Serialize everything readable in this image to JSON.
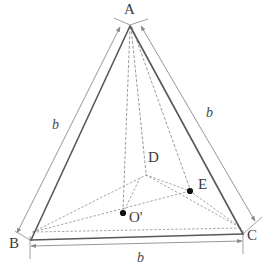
{
  "figure": {
    "kind": "geometry-diagram",
    "width": 274,
    "height": 277,
    "background_color": "#ffffff",
    "edge_color": "#555555",
    "dimension_color": "#8a8a8a",
    "construction_color": "#999999",
    "point_color": "#111111",
    "label_color": "#3b3b3b"
  },
  "vertices": [
    {
      "id": "A",
      "label": "A",
      "x": 130,
      "y": 25,
      "label_x": 124,
      "label_y": 2,
      "dot": false
    },
    {
      "id": "B",
      "label": "B",
      "x": 30,
      "y": 240,
      "label_x": 9,
      "label_y": 236,
      "dot": false
    },
    {
      "id": "C",
      "label": "C",
      "x": 243,
      "y": 234,
      "label_x": 247,
      "label_y": 228,
      "dot": false
    },
    {
      "id": "D",
      "label": "D",
      "x": 146,
      "y": 175,
      "label_x": 148,
      "label_y": 150,
      "dot": false
    },
    {
      "id": "E",
      "label": "E",
      "x": 190,
      "y": 191,
      "label_x": 198,
      "label_y": 177,
      "dot": true
    },
    {
      "id": "O'",
      "label": "O'",
      "x": 123,
      "y": 213,
      "label_x": 129,
      "label_y": 210,
      "dot": true
    }
  ],
  "edges": [
    {
      "from": "A",
      "to": "B",
      "style": "solid"
    },
    {
      "from": "A",
      "to": "C",
      "style": "solid"
    },
    {
      "from": "B",
      "to": "C",
      "style": "solid"
    }
  ],
  "construction_lines": [
    {
      "from": "A",
      "to": "O'",
      "style": "dashed"
    },
    {
      "from": "A",
      "to": "D",
      "style": "dashed"
    },
    {
      "from": "A",
      "to": "E",
      "style": "dashed"
    },
    {
      "from": "B",
      "to": "D",
      "style": "dotted"
    },
    {
      "from": "D",
      "to": "E",
      "style": "dotted"
    },
    {
      "from": "E",
      "to": "C",
      "style": "dotted"
    },
    {
      "from": "B",
      "to": "E",
      "style": "dotted"
    },
    {
      "from": "B",
      "to": "C",
      "style": "dotted-offset"
    },
    {
      "from": "O'",
      "to": "D",
      "style": "dotted"
    }
  ],
  "dimensions": [
    {
      "id": "dim-ab",
      "label": "b",
      "for_edge": "AB",
      "label_x": 52,
      "label_y": 118,
      "arrows": "both"
    },
    {
      "id": "dim-ac",
      "label": "b",
      "for_edge": "AC",
      "label_x": 206,
      "label_y": 106,
      "arrows": "both"
    },
    {
      "id": "dim-bc",
      "label": "b",
      "for_edge": "BC",
      "label_x": 137,
      "label_y": 251,
      "arrows": "both"
    }
  ]
}
